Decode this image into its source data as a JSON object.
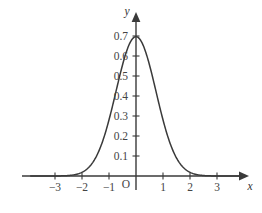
{
  "figure": {
    "background_color": "#ffffff",
    "line_color": "#3a3a3a",
    "text_color": "#444444",
    "origin_label": "O",
    "x_axis_name": "x",
    "y_axis_name": "y"
  },
  "chart_data": {
    "type": "line",
    "title": "",
    "subtitle": "",
    "xlabel": "x",
    "ylabel": "y",
    "xlim": [
      -3.9,
      3.9
    ],
    "ylim": [
      0,
      0.75
    ],
    "grid": false,
    "legend": null,
    "annotations": [],
    "axis_style": {
      "x_axis_arrow": true,
      "y_axis_arrow": true,
      "origin_marked": true,
      "origin_label": "O"
    },
    "xticks": [
      -3,
      -2,
      -1,
      1,
      2,
      3
    ],
    "xticklabels": [
      "−3",
      "−2",
      "−1",
      "1",
      "2",
      "3"
    ],
    "yticks": [
      0.1,
      0.2,
      0.3,
      0.4,
      0.5,
      0.6,
      0.7
    ],
    "yticklabels": [
      "0.1",
      "0.2",
      "0.3",
      "0.4",
      "0.5",
      "0.6",
      "0.7"
    ],
    "series": [
      {
        "name": "normal probability density",
        "formula": "y = 0.6967 * exp(-x^2 / 1.1)",
        "peak_x": 0,
        "peak_y": 0.6967,
        "x": [
          -3.9,
          -3.7,
          -3.5,
          -3.3,
          -3.1,
          -2.9,
          -2.7,
          -2.5,
          -2.3,
          -2.1,
          -1.9,
          -1.7,
          -1.5,
          -1.3,
          -1.1,
          -0.9,
          -0.7,
          -0.5,
          -0.3,
          -0.1,
          0,
          0.1,
          0.3,
          0.5,
          0.7,
          0.9,
          1.1,
          1.3,
          1.5,
          1.7,
          1.9,
          2.1,
          2.3,
          2.5,
          2.7,
          2.9,
          3.1,
          3.3,
          3.5,
          3.7,
          3.9
        ],
        "y": [
          0.0007,
          0.0016,
          0.0033,
          0.0066,
          0.0125,
          0.0227,
          0.0394,
          0.0654,
          0.1037,
          0.1572,
          0.2277,
          0.3153,
          0.4171,
          0.5267,
          0.6347,
          0.6178,
          0.4943,
          0.5784,
          0.6637,
          0.6904,
          0.6967,
          0.6904,
          0.6637,
          0.5784,
          0.4943,
          0.4069,
          0.2277,
          0.1572,
          0.1037,
          0.0654,
          0.0394,
          0.0227,
          0.0125,
          0.0066,
          0.0033,
          0.0016,
          0.0007,
          0.0003,
          0.0001,
          0.0,
          0.0
        ]
      }
    ]
  }
}
